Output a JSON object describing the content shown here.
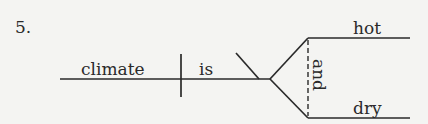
{
  "diagram": {
    "type": "sentence-diagram",
    "item_number": "5.",
    "subject": "climate",
    "verb": "is",
    "predicate_adjectives": [
      "hot",
      "dry"
    ],
    "conjunction": "and",
    "colors": {
      "ink": "#2a2a2a",
      "background": "#f4f4f2"
    }
  }
}
